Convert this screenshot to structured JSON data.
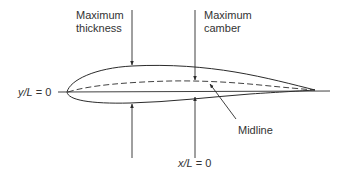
{
  "figure": {
    "type": "airfoil-geometry-diagram",
    "labels": {
      "max_thickness": [
        "Maximum",
        "thickness"
      ],
      "max_camber": [
        "Maximum",
        "camber"
      ],
      "midline": "Midline",
      "y_axis": {
        "var": "y/L",
        "eq": " = 0"
      },
      "x_axis": {
        "var": "x/L",
        "eq": " = 0"
      }
    },
    "colors": {
      "line": "#2b2b2b",
      "text": "#333333",
      "background": "#ffffff"
    }
  }
}
